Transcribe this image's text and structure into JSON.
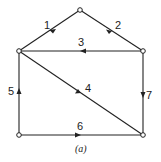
{
  "diagram": {
    "caption": "(a)",
    "nodes": [
      {
        "id": "top",
        "x": 80,
        "y": 10
      },
      {
        "id": "left",
        "x": 19,
        "y": 51
      },
      {
        "id": "right",
        "x": 143,
        "y": 51
      },
      {
        "id": "bottom-left",
        "x": 19,
        "y": 135
      },
      {
        "id": "bottom-right",
        "x": 143,
        "y": 135
      }
    ],
    "edges": [
      {
        "label": "1",
        "from": "top",
        "to": "left"
      },
      {
        "label": "2",
        "from": "top",
        "to": "right"
      },
      {
        "label": "3",
        "from": "right",
        "to": "left"
      },
      {
        "label": "4",
        "from": "left",
        "to": "bottom-right"
      },
      {
        "label": "5",
        "from": "bottom-left",
        "to": "left"
      },
      {
        "label": "6",
        "from": "bottom-left",
        "to": "bottom-right"
      },
      {
        "label": "7",
        "from": "right",
        "to": "bottom-right"
      }
    ],
    "colors": {
      "stroke": "#222222",
      "background": "#ffffff"
    }
  }
}
